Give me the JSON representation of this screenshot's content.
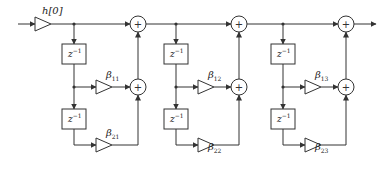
{
  "diagram": {
    "type": "cascade of second-order FIR sections (signal flow graph)",
    "input_gain": {
      "label": "h[0]"
    },
    "delay_label": {
      "base": "z",
      "exponent": "−1"
    },
    "adder_symbol": "+",
    "sections": [
      {
        "coef1": {
          "base": "β",
          "sub": "11"
        },
        "coef2": {
          "base": "β",
          "sub": "21"
        }
      },
      {
        "coef1": {
          "base": "β",
          "sub": "12"
        },
        "coef2": {
          "base": "β",
          "sub": "22"
        }
      },
      {
        "coef1": {
          "base": "β",
          "sub": "13"
        },
        "coef2": {
          "base": "β",
          "sub": "23"
        }
      }
    ],
    "colors": {
      "line": "#333333",
      "background": "#ffffff"
    }
  }
}
